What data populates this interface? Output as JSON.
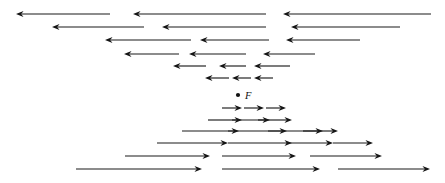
{
  "figure": {
    "name": "vector-field-diagram",
    "width": 445,
    "height": 183,
    "background_color": "#ffffff",
    "stroke_color": "#1b1b1b",
    "head_color": "#141414"
  },
  "labels": {
    "center_point_label": "F"
  },
  "chart_data": {
    "type": "scatter",
    "title": "",
    "subtitle": "",
    "xlabel": "",
    "ylabel": "",
    "grid": false,
    "legend": "none",
    "xlim": [
      0,
      445
    ],
    "ylim": [
      0,
      183
    ],
    "annotations": [
      {
        "name": "center-point",
        "kind": "point",
        "x": 238,
        "y": 95,
        "radius": 2.1
      },
      {
        "name": "center-point-label",
        "kind": "text",
        "text": "F",
        "x": 245,
        "y": 99,
        "italic": true,
        "font_size": 10.5
      }
    ],
    "series": [
      {
        "name": "leftward-arrows",
        "direction": "left",
        "count": 18,
        "head_length": 7.5,
        "head_half_width": 3.0,
        "vectors": [
          {
            "row": 1,
            "y": 14,
            "tail_x": 110,
            "tip_x": 16
          },
          {
            "row": 1,
            "y": 14,
            "tail_x": 266,
            "tip_x": 133
          },
          {
            "row": 1,
            "y": 14,
            "tail_x": 431,
            "tip_x": 283
          },
          {
            "row": 2,
            "y": 27,
            "tail_x": 144,
            "tip_x": 52
          },
          {
            "row": 2,
            "y": 27,
            "tail_x": 266,
            "tip_x": 162
          },
          {
            "row": 2,
            "y": 27,
            "tail_x": 400,
            "tip_x": 291
          },
          {
            "row": 3,
            "y": 40,
            "tail_x": 191,
            "tip_x": 105
          },
          {
            "row": 3,
            "y": 40,
            "tail_x": 269,
            "tip_x": 200
          },
          {
            "row": 3,
            "y": 40,
            "tail_x": 360,
            "tip_x": 286
          },
          {
            "row": 4,
            "y": 54,
            "tail_x": 179,
            "tip_x": 124
          },
          {
            "row": 4,
            "y": 54,
            "tail_x": 246,
            "tip_x": 189
          },
          {
            "row": 4,
            "y": 54,
            "tail_x": 315,
            "tip_x": 263
          },
          {
            "row": 5,
            "y": 66,
            "tail_x": 206,
            "tip_x": 173
          },
          {
            "row": 5,
            "y": 66,
            "tail_x": 246,
            "tip_x": 219
          },
          {
            "row": 5,
            "y": 66,
            "tail_x": 290,
            "tip_x": 254
          },
          {
            "row": 6,
            "y": 78,
            "tail_x": 229,
            "tip_x": 205
          },
          {
            "row": 6,
            "y": 78,
            "tail_x": 251,
            "tip_x": 232
          },
          {
            "row": 6,
            "y": 78,
            "tail_x": 273,
            "tip_x": 254
          }
        ]
      },
      {
        "name": "rightward-arrows",
        "direction": "right",
        "count": 21,
        "head_length": 7.5,
        "head_half_width": 3.0,
        "vectors": [
          {
            "row": 7,
            "y": 108,
            "tail_x": 222,
            "tip_x": 242
          },
          {
            "row": 7,
            "y": 108,
            "tail_x": 244,
            "tip_x": 264
          },
          {
            "row": 7,
            "y": 108,
            "tail_x": 266,
            "tip_x": 286
          },
          {
            "row": 8,
            "y": 120,
            "tail_x": 208,
            "tip_x": 242
          },
          {
            "row": 8,
            "y": 120,
            "tail_x": 232,
            "tip_x": 270
          },
          {
            "row": 8,
            "y": 120,
            "tail_x": 258,
            "tip_x": 292
          },
          {
            "row": 9,
            "y": 131,
            "tail_x": 182,
            "tip_x": 239
          },
          {
            "row": 9,
            "y": 131,
            "tail_x": 228,
            "tip_x": 287
          },
          {
            "row": 9,
            "y": 131,
            "tail_x": 268,
            "tip_x": 323
          },
          {
            "row": 9,
            "y": 131,
            "tail_x": 303,
            "tip_x": 338
          },
          {
            "row": 10,
            "y": 143,
            "tail_x": 157,
            "tip_x": 228
          },
          {
            "row": 10,
            "y": 143,
            "tail_x": 228,
            "tip_x": 292
          },
          {
            "row": 10,
            "y": 143,
            "tail_x": 286,
            "tip_x": 333
          },
          {
            "row": 10,
            "y": 143,
            "tail_x": 333,
            "tip_x": 373
          },
          {
            "row": 11,
            "y": 156,
            "tail_x": 125,
            "tip_x": 210
          },
          {
            "row": 11,
            "y": 156,
            "tail_x": 222,
            "tip_x": 296
          },
          {
            "row": 11,
            "y": 156,
            "tail_x": 310,
            "tip_x": 382
          },
          {
            "row": 12,
            "y": 169,
            "tail_x": 76,
            "tip_x": 202
          },
          {
            "row": 12,
            "y": 169,
            "tail_x": 222,
            "tip_x": 320
          },
          {
            "row": 12,
            "y": 169,
            "tail_x": 338,
            "tip_x": 430
          }
        ]
      }
    ]
  }
}
